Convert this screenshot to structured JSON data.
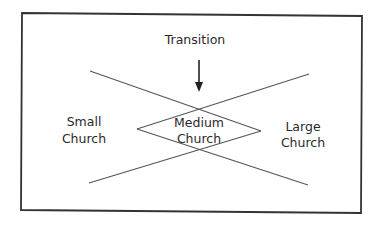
{
  "diagram": {
    "title": "Transition",
    "labels": {
      "small": [
        "Small",
        "Church"
      ],
      "medium": [
        "Medium",
        "Church"
      ],
      "large": [
        "Large",
        "Church"
      ]
    },
    "colors": {
      "border": "#333333",
      "lines": "#555555",
      "text": "#2a2a2a",
      "background": "#ffffff"
    }
  }
}
